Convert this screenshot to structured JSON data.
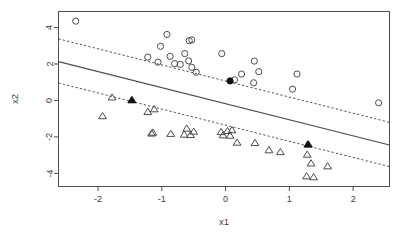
{
  "chart_data": {
    "type": "scatter",
    "title": "",
    "subtitle": "",
    "xlabel": "x1",
    "ylabel": "x2",
    "xlim": [
      -2.62,
      2.57
    ],
    "ylim": [
      -4.72,
      4.88
    ],
    "xticks": [
      -2,
      -1,
      0,
      1,
      2
    ],
    "xticklabels": [
      "-2",
      "-1",
      "0",
      "1",
      "2"
    ],
    "yticks": [
      -4,
      -2,
      0,
      2,
      4
    ],
    "yticklabels": [
      "-4",
      "-2",
      "0",
      "2",
      "4"
    ],
    "grid": false,
    "legend": "none",
    "background": "#ffffff",
    "foreground": "#4d4d4d",
    "series": [
      {
        "name": "class-circle",
        "marker": "circle-open",
        "color": "#4d4d4d",
        "points": [
          [
            -2.35,
            4.35
          ],
          [
            -0.92,
            3.62
          ],
          [
            -1.02,
            2.97
          ],
          [
            -0.57,
            3.28
          ],
          [
            -0.53,
            3.32
          ],
          [
            -0.06,
            2.57
          ],
          [
            -1.22,
            2.38
          ],
          [
            -0.87,
            2.42
          ],
          [
            -0.64,
            2.57
          ],
          [
            -1.06,
            2.1
          ],
          [
            -0.8,
            2.02
          ],
          [
            -0.71,
            1.98
          ],
          [
            -0.58,
            2.17
          ],
          [
            -0.46,
            1.55
          ],
          [
            -0.53,
            1.82
          ],
          [
            0.45,
            2.16
          ],
          [
            0.25,
            1.45
          ],
          [
            0.52,
            1.58
          ],
          [
            0.44,
            0.97
          ],
          [
            1.12,
            1.45
          ],
          [
            1.05,
            0.62
          ],
          [
            2.4,
            -0.13
          ],
          [
            0.14,
            1.13
          ]
        ]
      },
      {
        "name": "class-triangle",
        "marker": "triangle-open",
        "color": "#4d4d4d",
        "points": [
          [
            -1.78,
            0.18
          ],
          [
            -1.93,
            -0.85
          ],
          [
            -1.22,
            -0.62
          ],
          [
            -1.12,
            -0.47
          ],
          [
            -1.14,
            -1.75
          ],
          [
            -1.16,
            -1.8
          ],
          [
            -0.86,
            -1.82
          ],
          [
            -0.61,
            -1.53
          ],
          [
            -0.55,
            -1.88
          ],
          [
            -0.5,
            -1.7
          ],
          [
            -0.65,
            -1.86
          ],
          [
            -0.07,
            -1.72
          ],
          [
            -0.04,
            -1.9
          ],
          [
            0.03,
            -1.66
          ],
          [
            0.07,
            -1.92
          ],
          [
            0.1,
            -1.62
          ],
          [
            0.18,
            -2.3
          ],
          [
            0.46,
            -2.32
          ],
          [
            0.68,
            -2.72
          ],
          [
            0.86,
            -2.82
          ],
          [
            1.28,
            -2.96
          ],
          [
            1.34,
            -3.44
          ],
          [
            1.6,
            -3.6
          ],
          [
            1.27,
            -4.15
          ],
          [
            1.38,
            -4.2
          ],
          [
            -1.47,
            0.03
          ],
          [
            1.3,
            -2.4
          ]
        ]
      },
      {
        "name": "support-vectors-circle",
        "marker": "circle-filled",
        "color": "#111111",
        "points": [
          [
            0.07,
            1.07
          ]
        ]
      },
      {
        "name": "support-vectors-triangle",
        "marker": "triangle-filled",
        "color": "#111111",
        "points": [
          [
            -1.47,
            0.03
          ],
          [
            1.29,
            -2.4
          ]
        ]
      }
    ],
    "lines": [
      {
        "name": "decision-boundary",
        "style": "solid",
        "color": "#4d4d4d",
        "x": [
          -2.62,
          2.57
        ],
        "y": [
          2.13,
          -2.44
        ]
      },
      {
        "name": "upper-margin",
        "style": "dashed",
        "color": "#4d4d4d",
        "x": [
          -2.62,
          2.57
        ],
        "y": [
          3.38,
          -1.2
        ]
      },
      {
        "name": "lower-margin",
        "style": "dashed",
        "color": "#4d4d4d",
        "x": [
          -2.62,
          2.57
        ],
        "y": [
          0.96,
          -3.63
        ]
      }
    ]
  }
}
